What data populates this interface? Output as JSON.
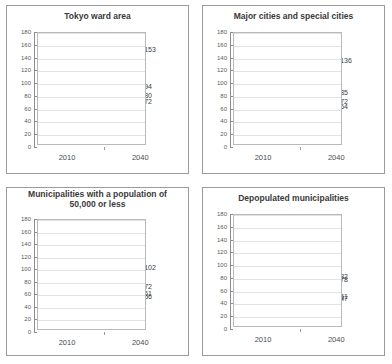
{
  "figure": {
    "panel_count": 4,
    "x_categories": [
      "2010",
      "2040"
    ],
    "y_ticks": [
      0,
      20,
      40,
      60,
      80,
      100,
      120,
      140,
      160,
      180
    ],
    "colors": {
      "series_black": "#2b2b2b",
      "series_dark_gray": "#6f6f6f",
      "series_mid_gray": "#8c8c8c",
      "series_light_gray": "#a8a8a8",
      "gridline": "#e2e2e2",
      "axis": "#8d8d8d",
      "panel_border": "#9a9a9a",
      "title_text": "#3a3a3a"
    }
  },
  "chart_data": [
    {
      "type": "line",
      "title": "Tokyo ward area",
      "title_lines": [
        "Tokyo ward area"
      ],
      "xlabel": "",
      "ylabel": "",
      "x": [
        "2010",
        "2040"
      ],
      "ylim": [
        0,
        180
      ],
      "grid": true,
      "legend": "none",
      "start_label": "100",
      "series": [
        {
          "name": "series-1",
          "values": [
            100,
            153
          ],
          "end_label": "153",
          "style": "dashed",
          "color": "#8c8c8c"
        },
        {
          "name": "series-2",
          "values": [
            100,
            94
          ],
          "end_label": "94",
          "style": "solid",
          "color": "#2b2b2b"
        },
        {
          "name": "series-3",
          "values": [
            100,
            80
          ],
          "end_label": "80",
          "style": "dashed",
          "color": "#9a9a9a"
        },
        {
          "name": "series-4",
          "values": [
            100,
            72
          ],
          "end_label": "72",
          "style": "solid",
          "color": "#a8a8a8"
        }
      ]
    },
    {
      "type": "line",
      "title": "Major cities and special cities",
      "title_lines": [
        "Major cities and special cities"
      ],
      "xlabel": "",
      "ylabel": "",
      "x": [
        "2010",
        "2040"
      ],
      "ylim": [
        0,
        180
      ],
      "grid": true,
      "legend": "none",
      "start_label": "100",
      "series": [
        {
          "name": "series-1",
          "values": [
            100,
            136
          ],
          "end_label": "136",
          "style": "dashed",
          "color": "#8c8c8c"
        },
        {
          "name": "series-2",
          "values": [
            100,
            85
          ],
          "end_label": "85",
          "style": "solid",
          "color": "#2b2b2b"
        },
        {
          "name": "series-3",
          "values": [
            100,
            72
          ],
          "end_label": "72",
          "style": "dashed",
          "color": "#9a9a9a"
        },
        {
          "name": "series-4",
          "values": [
            100,
            64
          ],
          "end_label": "64",
          "style": "solid",
          "color": "#a8a8a8"
        }
      ]
    },
    {
      "type": "line",
      "title": "Municipalities with a population of 50,000 or less",
      "title_lines": [
        "Municipalities with a population of",
        "50,000 or less"
      ],
      "xlabel": "",
      "ylabel": "",
      "x": [
        "2010",
        "2040"
      ],
      "ylim": [
        0,
        180
      ],
      "grid": true,
      "legend": "none",
      "start_label": "100",
      "series": [
        {
          "name": "series-1",
          "values": [
            100,
            102
          ],
          "end_label": "102",
          "style": "dashed",
          "color": "#6f6f6f"
        },
        {
          "name": "series-2",
          "values": [
            100,
            72
          ],
          "end_label": "72",
          "style": "solid",
          "color": "#2b2b2b"
        },
        {
          "name": "series-3",
          "values": [
            100,
            61
          ],
          "end_label": "61",
          "style": "solid",
          "color": "#9a9a9a"
        },
        {
          "name": "series-4",
          "values": [
            100,
            56
          ],
          "end_label": "56",
          "style": "solid",
          "color": "#a8a8a8"
        }
      ]
    },
    {
      "type": "line",
      "title": "Depopulated municipalities",
      "title_lines": [
        "Depopulated municipalities"
      ],
      "xlabel": "",
      "ylabel": "",
      "x": [
        "2010",
        "2040"
      ],
      "ylim": [
        0,
        180
      ],
      "grid": true,
      "legend": "none",
      "start_label": "100",
      "series": [
        {
          "name": "series-1",
          "values": [
            100,
            82
          ],
          "end_label": "82",
          "style": "dashed",
          "color": "#6f6f6f"
        },
        {
          "name": "series-2",
          "values": [
            100,
            78
          ],
          "end_label": "78",
          "style": "solid",
          "color": "#2b2b2b"
        },
        {
          "name": "series-3",
          "values": [
            100,
            51
          ],
          "end_label": "51",
          "style": "solid",
          "color": "#9a9a9a"
        },
        {
          "name": "series-4",
          "values": [
            100,
            47
          ],
          "end_label": "47",
          "style": "solid",
          "color": "#a8a8a8"
        }
      ]
    }
  ]
}
